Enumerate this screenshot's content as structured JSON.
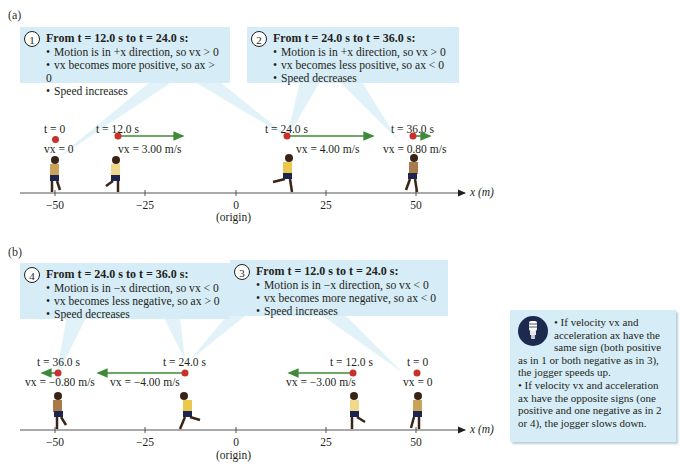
{
  "panels": {
    "a": {
      "label": "(a)",
      "callouts": [
        {
          "number": "1",
          "heading": "From t = 12.0 s to t = 24.0 s:",
          "bullets": [
            "Motion is in +x direction, so vx > 0",
            "vx becomes more positive, so ax > 0",
            "Speed increases"
          ]
        },
        {
          "number": "2",
          "heading": "From t = 24.0 s to t = 36.0 s:",
          "bullets": [
            "Motion is in +x direction, so vx > 0",
            "vx becomes less positive, so ax < 0",
            "Speed decreases"
          ]
        }
      ],
      "joggers": [
        {
          "time": "t = 0",
          "velocity": "vx = 0",
          "x_m": -50
        },
        {
          "time": "t = 12.0 s",
          "velocity": "vx = 3.00 m/s",
          "x_m": -32
        },
        {
          "time": "t = 24.0 s",
          "velocity": "vx = 4.00 m/s",
          "x_m": 14
        },
        {
          "time": "t = 36.0 s",
          "velocity": "vx = 0.80 m/s",
          "x_m": 49
        }
      ]
    },
    "b": {
      "label": "(b)",
      "callouts": [
        {
          "number": "4",
          "heading": "From t = 24.0 s to t = 36.0 s:",
          "bullets": [
            "Motion is in −x direction, so vx < 0",
            "vx becomes less negative, so ax > 0",
            "Speed decreases"
          ]
        },
        {
          "number": "3",
          "heading": "From t = 12.0 s to t = 24.0 s:",
          "bullets": [
            "Motion is in −x direction, so vx < 0",
            "vx becomes more negative, so ax < 0",
            "Speed increases"
          ]
        }
      ],
      "joggers": [
        {
          "time": "t = 36.0 s",
          "velocity": "vx = −0.80 m/s",
          "x_m": -49
        },
        {
          "time": "t = 24.0 s",
          "velocity": "vx = −4.00 m/s",
          "x_m": -14
        },
        {
          "time": "t = 12.0 s",
          "velocity": "vx = −3.00 m/s",
          "x_m": 32
        },
        {
          "time": "t = 0",
          "velocity": "vx = 0",
          "x_m": 50
        }
      ]
    }
  },
  "axis": {
    "ticks": [
      "−50",
      "−25",
      "0",
      "25",
      "50"
    ],
    "origin_label": "(origin)",
    "axis_label": "x (m)"
  },
  "info_box": {
    "icon": "lightbulb-icon",
    "bullet1": "If velocity vx and acceleration ax have the same sign (both positive as in 1 or both negative as in 3), the jogger speeds up.",
    "bullet2": "If velocity vx and acceleration ax have the opposite signs (one positive and one negative as in 2 or 4), the jogger slows down."
  },
  "colors": {
    "callout_bg": "#d6ecf6",
    "dot": "#c8322a",
    "velocity_arrow": "#3f8a3a",
    "bulb_circle": "#1d2a4f"
  }
}
